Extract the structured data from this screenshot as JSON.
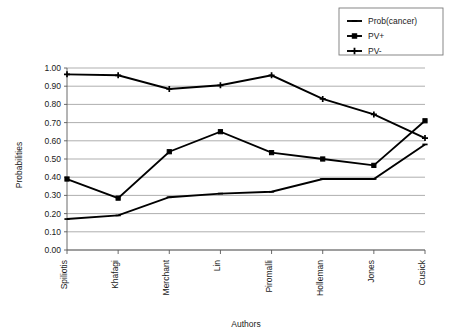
{
  "chart_data": {
    "type": "line",
    "title": "",
    "xlabel": "Authors",
    "ylabel": "Probabilities",
    "categories": [
      "Spiliotis",
      "Khafagi",
      "Merchant",
      "Lin",
      "Piromalli",
      "Holleman",
      "Jones",
      "Cusick"
    ],
    "ylim": [
      0.0,
      1.0
    ],
    "ytick_labels": [
      "0.00",
      "0.10",
      "0.20",
      "0.30",
      "0.40",
      "0.50",
      "0.60",
      "0.70",
      "0.80",
      "0.90",
      "1.00"
    ],
    "ytick_values": [
      0.0,
      0.1,
      0.2,
      0.3,
      0.4,
      0.5,
      0.6,
      0.7,
      0.8,
      0.9,
      1.0
    ],
    "grid": true,
    "grid_axis": "y",
    "legend_position": "top-right",
    "series": [
      {
        "name": "Prob(cancer)",
        "marker": "dash-marker",
        "color": "#000000",
        "values": [
          0.17,
          0.19,
          0.29,
          0.31,
          0.32,
          0.39,
          0.39,
          0.58
        ]
      },
      {
        "name": "PV+",
        "marker": "square-marker",
        "color": "#000000",
        "values": [
          0.39,
          0.285,
          0.54,
          0.65,
          0.535,
          0.5,
          0.465,
          0.71
        ]
      },
      {
        "name": "PV-",
        "marker": "cross-marker",
        "color": "#000000",
        "values": [
          0.965,
          0.96,
          0.885,
          0.905,
          0.96,
          0.83,
          0.745,
          0.615
        ]
      }
    ]
  },
  "legend": {
    "items": [
      {
        "label": "Prob(cancer)"
      },
      {
        "label": "PV+"
      },
      {
        "label": "PV-"
      }
    ]
  },
  "axes": {
    "y_axis_title": "Probabilities",
    "x_axis_title": "Authors"
  }
}
